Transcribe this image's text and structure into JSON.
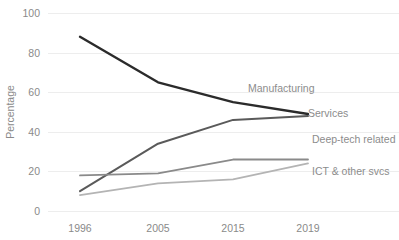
{
  "chart_data": {
    "type": "line",
    "title": "",
    "subtitle": "",
    "xlabel": "",
    "ylabel": "Percentage",
    "categories": [
      "1996",
      "2005",
      "2015",
      "2019"
    ],
    "x_tick_labels": [
      "1996",
      "2005",
      "2015",
      "2019"
    ],
    "y_tick_labels": [
      "0",
      "20",
      "40",
      "60",
      "80",
      "100"
    ],
    "y_ticks": [
      0,
      20,
      40,
      60,
      80,
      100
    ],
    "ylim": [
      0,
      100
    ],
    "grid": "horizontal",
    "legend_position": "inline-right-of-line-end",
    "series": [
      {
        "name": "Manufacturing",
        "label": "Manufacturing",
        "color": "#2b2b2b",
        "width": 2.4,
        "values": [
          88,
          65,
          55,
          49
        ]
      },
      {
        "name": "Services",
        "label": "Services",
        "color": "#5a5a5a",
        "width": 2.0,
        "values": [
          10,
          34,
          46,
          48
        ]
      },
      {
        "name": "Deep-tech related",
        "label": "Deep-tech related",
        "color": "#8a8a8a",
        "width": 1.8,
        "values": [
          18,
          19,
          26,
          26
        ]
      },
      {
        "name": "ICT & other svcs",
        "label": "ICT & other svcs",
        "color": "#b4b4b4",
        "width": 1.8,
        "values": [
          8,
          14,
          16,
          24
        ]
      }
    ],
    "annotations": [
      {
        "text": "Manufacturing",
        "x": 248,
        "y": 92
      },
      {
        "text": "Services",
        "x": 308,
        "y": 117
      },
      {
        "text": "Deep-tech related",
        "x": 312,
        "y": 143
      },
      {
        "text": "ICT & other svcs",
        "x": 312,
        "y": 175
      }
    ]
  },
  "axis": {
    "y_title": "Percentage"
  }
}
